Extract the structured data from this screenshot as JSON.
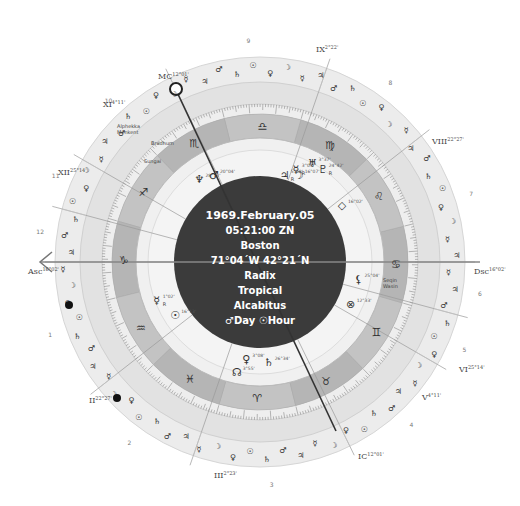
{
  "chart_info": {
    "date": "1969.February.05",
    "time": "05:21:00 ZN",
    "place": "Boston",
    "coords": "71°04´W 42°21´N",
    "type": "Radix",
    "zodiac": "Tropical",
    "house_system": "Alcabitus",
    "day_hour": "♂Day ☉Hour"
  },
  "angles": {
    "asc": {
      "label": "Asc",
      "deg": "16°02'"
    },
    "dsc": {
      "label": "Dsc",
      "deg": "16°02'"
    },
    "mc": {
      "label": "MC",
      "deg": "12°01'"
    },
    "ic": {
      "label": "IC",
      "deg": "12°01'"
    }
  },
  "house_cusps": [
    {
      "label": "II",
      "deg": "22°27'"
    },
    {
      "label": "III",
      "deg": "2°23'"
    },
    {
      "label": "V",
      "deg": "4°11'"
    },
    {
      "label": "VI",
      "deg": "25°14'"
    },
    {
      "label": "VIII",
      "deg": "22°27'"
    },
    {
      "label": "IX",
      "deg": "2°22'"
    },
    {
      "label": "XI",
      "deg": "4°11'"
    },
    {
      "label": "XII",
      "deg": "25°14'"
    }
  ],
  "house_numbers": [
    "1",
    "2",
    "3",
    "4",
    "5",
    "6",
    "7",
    "8",
    "9",
    "10",
    "11",
    "12"
  ],
  "signs": [
    {
      "name": "capricorn",
      "glyph": "♑"
    },
    {
      "name": "aquarius",
      "glyph": "♒"
    },
    {
      "name": "pisces",
      "glyph": "♓"
    },
    {
      "name": "aries",
      "glyph": "♈"
    },
    {
      "name": "taurus",
      "glyph": "♉"
    },
    {
      "name": "gemini",
      "glyph": "♊"
    },
    {
      "name": "cancer",
      "glyph": "♋"
    },
    {
      "name": "leo",
      "glyph": "♌"
    },
    {
      "name": "virgo",
      "glyph": "♍"
    },
    {
      "name": "libra",
      "glyph": "♎"
    },
    {
      "name": "scorpio",
      "glyph": "♏"
    },
    {
      "name": "sagittarius",
      "glyph": "♐"
    }
  ],
  "planets": [
    {
      "name": "uranus",
      "glyph": "♅",
      "deg": "3°37'",
      "retro": ""
    },
    {
      "name": "pluto",
      "glyph": "♇",
      "deg": "24°42'",
      "retro": "R"
    },
    {
      "name": "mercury-r",
      "glyph": "☿",
      "deg": "3°09'",
      "retro": "R"
    },
    {
      "name": "jupiter",
      "glyph": "♃",
      "deg": "5°58'",
      "retro": "R"
    },
    {
      "name": "moon",
      "glyph": "☽",
      "deg": "16°07'",
      "retro": ""
    },
    {
      "name": "neptune",
      "glyph": "♆",
      "deg": "28°13'",
      "retro": ""
    },
    {
      "name": "mars",
      "glyph": "♂",
      "deg": "20°04'",
      "retro": ""
    },
    {
      "name": "part-of-fortune",
      "glyph": "◇",
      "deg": "16°02'",
      "retro": ""
    },
    {
      "name": "lilith",
      "glyph": "⚸",
      "deg": "25°04'",
      "retro": ""
    },
    {
      "name": "vertex",
      "glyph": "⊗",
      "deg": "12°33'",
      "retro": ""
    },
    {
      "name": "mercury",
      "glyph": "☿",
      "deg": "1°02'",
      "retro": "R"
    },
    {
      "name": "sun",
      "glyph": "☉",
      "deg": "16°13'",
      "retro": ""
    },
    {
      "name": "venus",
      "glyph": "♀",
      "deg": "3°08'",
      "retro": ""
    },
    {
      "name": "saturn",
      "glyph": "♄",
      "deg": "26°34'",
      "retro": ""
    },
    {
      "name": "node",
      "glyph": "☊",
      "deg": "3°55'",
      "retro": ""
    }
  ],
  "fixed_stars": [
    "Alphekka",
    "Menkent",
    "Bradhum",
    "Sungai",
    "Seqin",
    "Wasin"
  ],
  "colors": {
    "outer_ring": "#e9e9e9",
    "zodiac_band": "#b3b3b3",
    "zodiac_band_alt": "#c4c4c4",
    "inner_ring": "#efefef",
    "center": "#3b3b3b"
  }
}
